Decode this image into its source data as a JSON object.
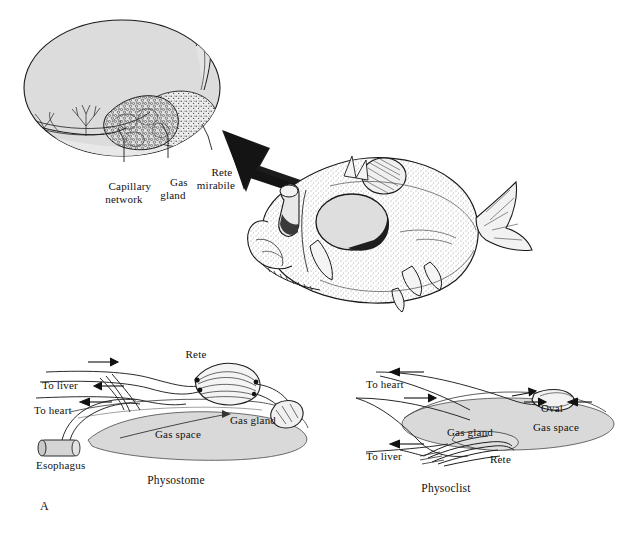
{
  "figure": {
    "panel_label": "A",
    "background_color": "#ffffff",
    "ink_color": "#111111",
    "fill_gray": "#d9d9d9",
    "width": 635,
    "height": 539
  },
  "inset": {
    "title_implicit": "swim bladder detail",
    "labels": [
      {
        "id": "capillary-network",
        "text": "Capillary\nnetwork",
        "x": 124,
        "y": 172
      },
      {
        "id": "gas-gland",
        "text": "Gas\ngland",
        "x": 172,
        "y": 168
      },
      {
        "id": "rete-mirabile",
        "text": "Rete\nmirabile",
        "x": 215,
        "y": 160
      }
    ]
  },
  "fish": {
    "name": "deep-sea fish",
    "swim_bladder_label": "swim bladder"
  },
  "arrow": {
    "name": "magnify-arrow",
    "direction": "up-left",
    "style": "gradient-taper"
  },
  "physostome": {
    "caption": "Physostome",
    "caption_x": 176,
    "caption_y": 480,
    "labels": [
      {
        "id": "rete",
        "text": "Rete",
        "x": 196,
        "y": 354
      },
      {
        "id": "to-liver",
        "text": "To liver",
        "x": 44,
        "y": 385
      },
      {
        "id": "to-heart",
        "text": "To heart",
        "x": 38,
        "y": 410
      },
      {
        "id": "esophagus",
        "text": "Esophagus",
        "x": 41,
        "y": 458
      },
      {
        "id": "gas-space",
        "text": "Gas space",
        "x": 155,
        "y": 432
      },
      {
        "id": "gas-gland",
        "text": "Gas gland",
        "x": 226,
        "y": 418
      }
    ],
    "flow_arrows": [
      {
        "id": "arrow-in",
        "direction": "right"
      },
      {
        "id": "arrow-liver",
        "direction": "left"
      },
      {
        "id": "arrow-heart",
        "direction": "left"
      }
    ]
  },
  "physoclist": {
    "caption": "Physoclist",
    "caption_x": 446,
    "caption_y": 488,
    "labels": [
      {
        "id": "to-heart",
        "text": "To heart",
        "x": 368,
        "y": 384
      },
      {
        "id": "oval",
        "text": "Oval",
        "x": 521,
        "y": 406
      },
      {
        "id": "gas-space",
        "text": "Gas space",
        "x": 540,
        "y": 425
      },
      {
        "id": "gas-gland",
        "text": "Gas gland",
        "x": 462,
        "y": 430
      },
      {
        "id": "rete",
        "text": "Rete",
        "x": 492,
        "y": 457
      },
      {
        "id": "to-liver",
        "text": "To liver",
        "x": 368,
        "y": 455
      }
    ],
    "flow_arrows": [
      {
        "id": "arrow-heart",
        "direction": "left"
      },
      {
        "id": "arrow-in",
        "direction": "right"
      },
      {
        "id": "arrow-liver",
        "direction": "left"
      },
      {
        "id": "arrow-oval-a",
        "direction": "right"
      },
      {
        "id": "arrow-oval-b",
        "direction": "left"
      }
    ]
  }
}
